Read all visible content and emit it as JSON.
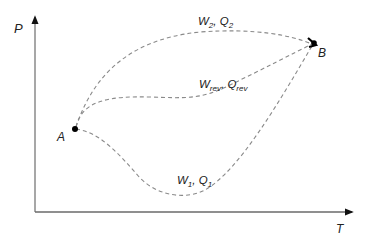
{
  "diagram": {
    "axes": {
      "y_label": "P",
      "x_label": "T",
      "color": "#7a7a7a"
    },
    "points": [
      {
        "id": "A",
        "label": "A",
        "x": 75,
        "y": 129
      },
      {
        "id": "B",
        "label": "B",
        "x": 312,
        "y": 43
      }
    ],
    "paths": [
      {
        "id": "path2",
        "work": "W",
        "work_sub": "2",
        "sep": ", ",
        "heat": "Q",
        "heat_sub": "2"
      },
      {
        "id": "path-rev",
        "work": "W",
        "work_sub": "rev",
        "sep": ", ",
        "heat": "Q",
        "heat_sub": "rev"
      },
      {
        "id": "path1",
        "work": "W",
        "work_sub": "1",
        "sep": ", ",
        "heat": "Q",
        "heat_sub": "1"
      }
    ],
    "colors": {
      "curve": "#8a8a8a",
      "axis": "#7a7a7a",
      "point": "#000000",
      "text": "#222222"
    }
  }
}
